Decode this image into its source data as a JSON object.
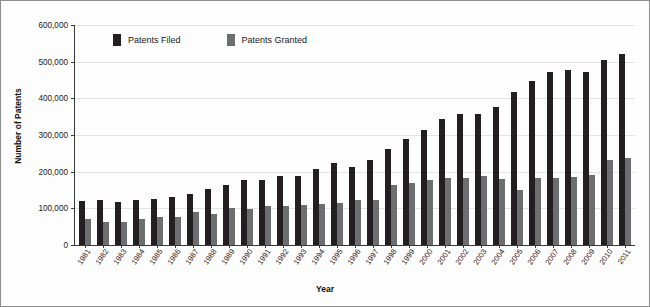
{
  "chart_data": {
    "type": "bar",
    "title": "",
    "xlabel": "Year",
    "ylabel": "Number of Patents",
    "ylim": [
      0,
      600000
    ],
    "ytick_labels": [
      "600,000",
      "500,000",
      "400,000",
      "300,000",
      "200,000",
      "100,000",
      "0"
    ],
    "ytick_values": [
      600000,
      500000,
      400000,
      300000,
      200000,
      100000,
      0
    ],
    "grid": true,
    "legend_position": "top-left-inside",
    "categories": [
      "1981",
      "1982",
      "1983",
      "1984",
      "1985",
      "1986",
      "1987",
      "1988",
      "1989",
      "1990",
      "1991",
      "1992",
      "1993",
      "1994",
      "1995",
      "1996",
      "1997",
      "1998",
      "1999",
      "2000",
      "2001",
      "2002",
      "2003",
      "2004",
      "2005",
      "2006",
      "2007",
      "2008",
      "2009",
      "2010",
      "2011"
    ],
    "series": [
      {
        "name": "Patents Filed",
        "color": "#231f20",
        "values": [
          120000,
          122000,
          117000,
          123000,
          126000,
          132000,
          140000,
          152000,
          163000,
          176000,
          178000,
          187000,
          189000,
          207000,
          224000,
          212000,
          233000,
          261000,
          289000,
          315000,
          345000,
          357000,
          356000,
          376000,
          417000,
          446000,
          473000,
          476000,
          471000,
          505000,
          521000
        ]
      },
      {
        "name": "Patents Granted",
        "color": "#6d6e70",
        "values": [
          71000,
          64000,
          62000,
          72000,
          77000,
          77000,
          89000,
          84000,
          102000,
          99000,
          106000,
          107000,
          109000,
          113000,
          114000,
          122000,
          124000,
          163000,
          169000,
          176000,
          184000,
          184000,
          187000,
          181000,
          151000,
          183000,
          182000,
          185000,
          191000,
          233000,
          237000
        ]
      }
    ]
  }
}
